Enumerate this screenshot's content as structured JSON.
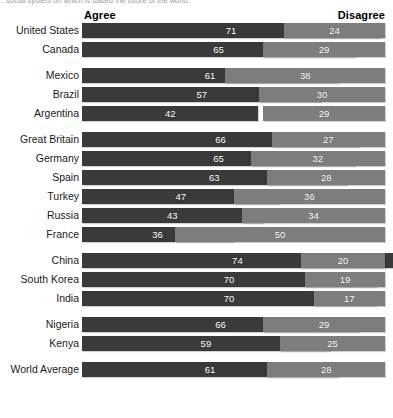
{
  "caption_fragment": "...social system on which is based the future of the world.",
  "header": {
    "agree_label": "Agree",
    "disagree_label": "Disagree"
  },
  "colors": {
    "agree": "#3a3a3a",
    "disagree": "#7d7d7d",
    "background": "#ffffff",
    "value_text": "#ffffff",
    "label_text": "#1a1a1a"
  },
  "chart_data": {
    "type": "bar",
    "title": "",
    "subtitle": "",
    "xlabel": "",
    "ylabel": "",
    "orientation": "horizontal",
    "layout": "diverging-paired",
    "grid": false,
    "legend_position": "top",
    "xlim": [
      0,
      100
    ],
    "categories": [
      "United States",
      "Canada",
      "Mexico",
      "Brazil",
      "Argentina",
      "Great Britain",
      "Germany",
      "Spain",
      "Turkey",
      "Russia",
      "France",
      "China",
      "South Korea",
      "India",
      "Nigeria",
      "Kenya",
      "World Average"
    ],
    "series": [
      {
        "name": "Agree",
        "color": "#3a3a3a",
        "values": [
          71,
          65,
          61,
          57,
          42,
          66,
          65,
          63,
          47,
          43,
          36,
          74,
          70,
          70,
          66,
          59,
          61
        ]
      },
      {
        "name": "Disagree",
        "color": "#7d7d7d",
        "values": [
          24,
          29,
          38,
          30,
          29,
          27,
          32,
          28,
          36,
          34,
          50,
          20,
          19,
          17,
          29,
          25,
          28
        ]
      }
    ],
    "groups": [
      {
        "group_name": "north-america",
        "rows": [
          {
            "label": "United States",
            "agree": 71,
            "disagree": 24
          },
          {
            "label": "Canada",
            "agree": 65,
            "disagree": 29
          }
        ]
      },
      {
        "group_name": "latin-america",
        "rows": [
          {
            "label": "Mexico",
            "agree": 61,
            "disagree": 38
          },
          {
            "label": "Brazil",
            "agree": 57,
            "disagree": 30
          },
          {
            "label": "Argentina",
            "agree": 42,
            "disagree": 29
          }
        ]
      },
      {
        "group_name": "europe",
        "rows": [
          {
            "label": "Great Britain",
            "agree": 66,
            "disagree": 27
          },
          {
            "label": "Germany",
            "agree": 65,
            "disagree": 32
          },
          {
            "label": "Spain",
            "agree": 63,
            "disagree": 28
          },
          {
            "label": "Turkey",
            "agree": 47,
            "disagree": 36
          },
          {
            "label": "Russia",
            "agree": 43,
            "disagree": 34
          },
          {
            "label": "France",
            "agree": 36,
            "disagree": 50
          }
        ]
      },
      {
        "group_name": "asia",
        "rows": [
          {
            "label": "China",
            "agree": 74,
            "disagree": 20
          },
          {
            "label": "South Korea",
            "agree": 70,
            "disagree": 19
          },
          {
            "label": "India",
            "agree": 70,
            "disagree": 17
          }
        ]
      },
      {
        "group_name": "africa",
        "rows": [
          {
            "label": "Nigeria",
            "agree": 66,
            "disagree": 29
          },
          {
            "label": "Kenya",
            "agree": 59,
            "disagree": 25
          }
        ]
      },
      {
        "group_name": "world-average",
        "rows": [
          {
            "label": "World Average",
            "agree": 61,
            "disagree": 28
          }
        ]
      }
    ]
  }
}
